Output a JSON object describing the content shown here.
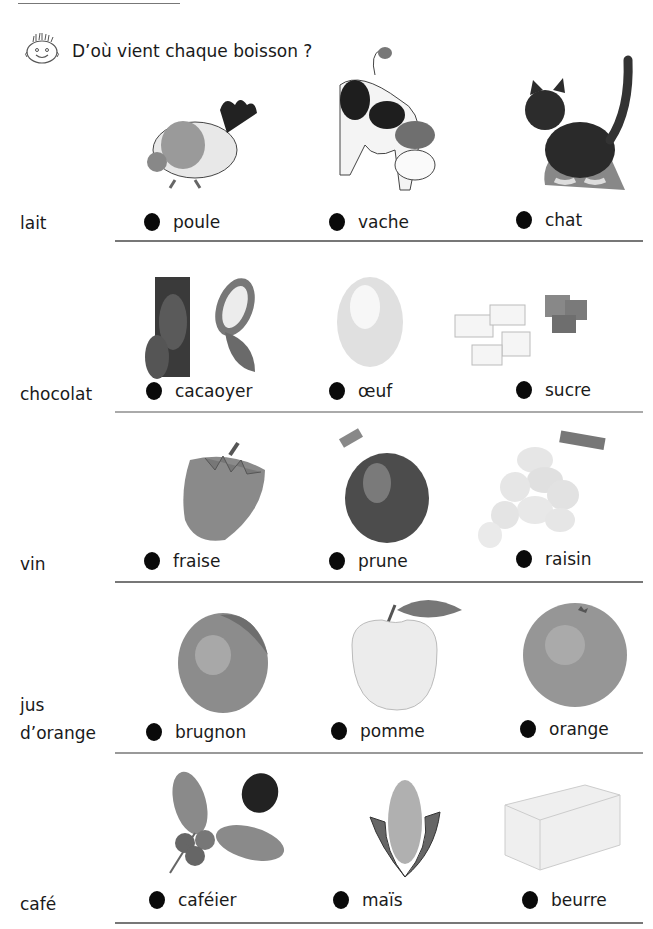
{
  "header": {
    "title": "D’où vient chaque boisson ?",
    "icon": "smiley-face-icon"
  },
  "rows": [
    {
      "drink": "lait",
      "choices": [
        {
          "label": "poule",
          "icon": "hen-icon"
        },
        {
          "label": "vache",
          "icon": "cow-icon"
        },
        {
          "label": "chat",
          "icon": "cat-icon"
        }
      ]
    },
    {
      "drink": "chocolat",
      "choices": [
        {
          "label": "cacaoyer",
          "icon": "cacao-tree-icon"
        },
        {
          "label": "œuf",
          "icon": "egg-icon"
        },
        {
          "label": "sucre",
          "icon": "sugar-cubes-icon"
        }
      ]
    },
    {
      "drink": "vin",
      "choices": [
        {
          "label": "fraise",
          "icon": "strawberry-icon"
        },
        {
          "label": "prune",
          "icon": "plum-icon"
        },
        {
          "label": "raisin",
          "icon": "grapes-icon"
        }
      ]
    },
    {
      "drink_line1": "jus",
      "drink_line2": "d’orange",
      "choices": [
        {
          "label": "brugnon",
          "icon": "nectarine-icon"
        },
        {
          "label": "pomme",
          "icon": "apple-icon"
        },
        {
          "label": "orange",
          "icon": "orange-icon"
        }
      ]
    },
    {
      "drink": "café",
      "choices": [
        {
          "label": "caféier",
          "icon": "coffee-plant-icon"
        },
        {
          "label": "maïs",
          "icon": "corn-icon"
        },
        {
          "label": "beurre",
          "icon": "butter-icon"
        }
      ]
    }
  ],
  "colors": {
    "dot": "#0a0a0a",
    "divider": "#777777",
    "text": "#1a1a1a"
  }
}
